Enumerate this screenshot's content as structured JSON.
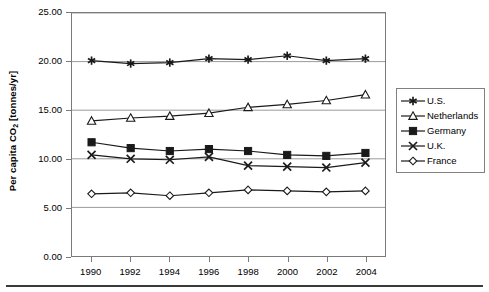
{
  "chart_data": {
    "type": "line",
    "title": "",
    "xlabel": "",
    "ylabel": "Per capita CO2 [tonnes/yr]",
    "ylabel_prefix": "Per capita CO",
    "ylabel_sub": "2",
    "ylabel_suffix": " [tonnes/yr]",
    "x": [
      1990,
      1992,
      1994,
      1996,
      1998,
      2000,
      2002,
      2004
    ],
    "categories": [
      "1990",
      "1992",
      "1994",
      "1996",
      "1998",
      "2000",
      "2002",
      "2004"
    ],
    "xlim": [
      1989,
      2005
    ],
    "ylim": [
      0.0,
      25.0
    ],
    "yticks": [
      0.0,
      5.0,
      10.0,
      15.0,
      20.0,
      25.0
    ],
    "ytick_labels": [
      "0.00",
      "5.00",
      "10.00",
      "15.00",
      "20.00",
      "25.00"
    ],
    "grid": "horizontal",
    "legend_position": "right",
    "series": [
      {
        "name": "U.S.",
        "marker": "asterisk",
        "color": "#000000",
        "values": [
          20.1,
          19.8,
          19.9,
          20.3,
          20.2,
          20.6,
          20.1,
          20.3
        ]
      },
      {
        "name": "Netherlands",
        "marker": "triangle-open",
        "color": "#000000",
        "values": [
          13.9,
          14.2,
          14.4,
          14.7,
          15.3,
          15.6,
          16.0,
          16.6
        ]
      },
      {
        "name": "Germany",
        "marker": "square-filled",
        "color": "#000000",
        "values": [
          11.7,
          11.1,
          10.8,
          11.0,
          10.8,
          10.4,
          10.3,
          10.6
        ]
      },
      {
        "name": "U.K.",
        "marker": "x-cross",
        "color": "#000000",
        "values": [
          10.4,
          10.0,
          9.9,
          10.2,
          9.3,
          9.2,
          9.1,
          9.6
        ]
      },
      {
        "name": "France",
        "marker": "diamond-open",
        "color": "#000000",
        "values": [
          6.4,
          6.5,
          6.2,
          6.5,
          6.8,
          6.7,
          6.6,
          6.7
        ]
      }
    ]
  },
  "axis": {
    "ytick_labels": [
      "25.00",
      "20.00",
      "15.00",
      "10.00",
      "5.00",
      "0.00"
    ],
    "xtick_labels": [
      "1990",
      "1992",
      "1994",
      "1996",
      "1998",
      "2000",
      "2002",
      "2004"
    ]
  },
  "legend": {
    "items": [
      {
        "label": "U.S.",
        "icon": "asterisk-marker-icon"
      },
      {
        "label": "Netherlands",
        "icon": "triangle-open-marker-icon"
      },
      {
        "label": "Germany",
        "icon": "square-filled-marker-icon"
      },
      {
        "label": "U.K.",
        "icon": "x-cross-marker-icon"
      },
      {
        "label": "France",
        "icon": "diamond-open-marker-icon"
      }
    ]
  },
  "colors": {
    "line": "#1a1a1a",
    "grid": "#9a9a9a",
    "frame": "#7a7a7a",
    "rule": "#3a3a3a",
    "background": "#ffffff"
  }
}
